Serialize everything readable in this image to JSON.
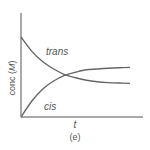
{
  "chart_data": {
    "type": "line",
    "title": "",
    "caption": "(e)",
    "xlabel": "t",
    "ylabel_prefix": "conc (",
    "ylabel_unit": "M",
    "ylabel_suffix": ")",
    "grid": false,
    "legend": "inline labels",
    "x": [
      0,
      1,
      2,
      3,
      4,
      5,
      6,
      7,
      8,
      9,
      10
    ],
    "series": [
      {
        "name": "trans",
        "values": [
          1.0,
          0.82,
          0.69,
          0.6,
          0.53,
          0.49,
          0.46,
          0.44,
          0.43,
          0.425,
          0.42
        ]
      },
      {
        "name": "cis",
        "values": [
          0.0,
          0.2,
          0.35,
          0.45,
          0.52,
          0.56,
          0.59,
          0.6,
          0.61,
          0.615,
          0.62
        ]
      }
    ],
    "xlim": [
      0,
      10
    ],
    "ylim": [
      0,
      1.3
    ],
    "colors": {
      "axis": "#555555",
      "curve": "#666666",
      "text": "#555555"
    }
  },
  "labels": {
    "trans": "trans",
    "cis": "cis",
    "x_axis": "t",
    "caption": "(e)"
  }
}
